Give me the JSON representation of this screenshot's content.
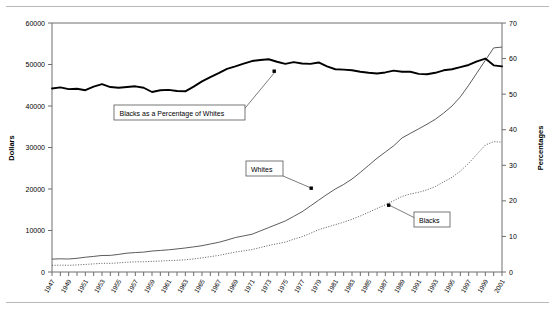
{
  "chart_data": {
    "type": "line",
    "title": "",
    "xlabel": "",
    "ylabel": "Dollars",
    "y2label": "Percentages",
    "xlim": [
      1947,
      2001
    ],
    "ylim": [
      0,
      60000
    ],
    "y2lim": [
      0,
      70
    ],
    "grid": false,
    "legend_position": "inline-callouts",
    "y_ticks": [
      "0",
      "10000",
      "20000",
      "30000",
      "40000",
      "50000",
      "60000"
    ],
    "y2_ticks": [
      "0",
      "10",
      "20",
      "30",
      "40",
      "50",
      "60",
      "70"
    ],
    "x_ticks": [
      "1947",
      "1949",
      "1951",
      "1953",
      "1955",
      "1957",
      "1959",
      "1961",
      "1963",
      "1965",
      "1967",
      "1969",
      "1971",
      "1973",
      "1975",
      "1977",
      "1979",
      "1981",
      "1983",
      "1985",
      "1987",
      "1989",
      "1991",
      "1993",
      "1995",
      "1997",
      "1999",
      "2001"
    ],
    "x": [
      1947,
      1948,
      1949,
      1950,
      1951,
      1952,
      1953,
      1954,
      1955,
      1956,
      1957,
      1958,
      1959,
      1960,
      1961,
      1962,
      1963,
      1964,
      1965,
      1966,
      1967,
      1968,
      1969,
      1970,
      1971,
      1972,
      1973,
      1974,
      1975,
      1976,
      1977,
      1978,
      1979,
      1980,
      1981,
      1982,
      1983,
      1984,
      1985,
      1986,
      1987,
      1988,
      1989,
      1990,
      1991,
      1992,
      1993,
      1994,
      1995,
      1996,
      1997,
      1998,
      1999,
      2000,
      2001
    ],
    "series": [
      {
        "name": "Whites",
        "axis": "left",
        "style": "solid-thin",
        "units": "Dollars",
        "values": [
          3100,
          3180,
          3130,
          3300,
          3560,
          3760,
          3980,
          4000,
          4250,
          4540,
          4690,
          4790,
          5060,
          5190,
          5350,
          5560,
          5790,
          6050,
          6340,
          6750,
          7150,
          7700,
          8300,
          8700,
          9100,
          9900,
          10700,
          11500,
          12300,
          13400,
          14500,
          15900,
          17300,
          18700,
          20000,
          21100,
          22400,
          24000,
          25700,
          27400,
          28900,
          30400,
          32300,
          33400,
          34500,
          35600,
          36800,
          38300,
          40000,
          42200,
          45000,
          48000,
          51000,
          54000,
          54200
        ]
      },
      {
        "name": "Blacks",
        "axis": "left",
        "style": "dotted",
        "units": "Dollars",
        "values": [
          1600,
          1650,
          1610,
          1700,
          1820,
          1960,
          2100,
          2080,
          2200,
          2360,
          2450,
          2480,
          2560,
          2650,
          2740,
          2830,
          2940,
          3150,
          3400,
          3700,
          4000,
          4400,
          4800,
          5100,
          5400,
          5900,
          6400,
          6800,
          7200,
          7900,
          8500,
          9300,
          10200,
          10800,
          11400,
          12000,
          12700,
          13500,
          14400,
          15300,
          16200,
          17200,
          18200,
          18800,
          19200,
          19800,
          20600,
          21700,
          22800,
          24300,
          26200,
          28400,
          30600,
          31400,
          31300
        ]
      },
      {
        "name": "Blacks as a Percentage of Whites",
        "axis": "right",
        "style": "solid-thick",
        "units": "Percentages",
        "values": [
          51.6,
          51.9,
          51.4,
          51.5,
          51.1,
          52.1,
          52.8,
          52.0,
          51.8,
          52.0,
          52.2,
          51.8,
          50.6,
          51.1,
          51.2,
          50.9,
          50.8,
          52.1,
          53.6,
          54.8,
          55.9,
          57.1,
          57.8,
          58.6,
          59.3,
          59.6,
          59.8,
          59.1,
          58.5,
          59.0,
          58.6,
          58.5,
          58.9,
          57.8,
          57.0,
          56.9,
          56.7,
          56.3,
          56.0,
          55.8,
          56.1,
          56.6,
          56.3,
          56.3,
          55.7,
          55.6,
          56.0,
          56.7,
          57.0,
          57.6,
          58.2,
          59.2,
          60.0,
          58.1,
          57.8
        ]
      }
    ],
    "annotations": [
      {
        "label": "Blacks as a Percentage of Whites",
        "target_series": "Blacks as a Percentage of Whites"
      },
      {
        "label": "Whites",
        "target_series": "Whites"
      },
      {
        "label": "Blacks",
        "target_series": "Blacks"
      }
    ]
  }
}
